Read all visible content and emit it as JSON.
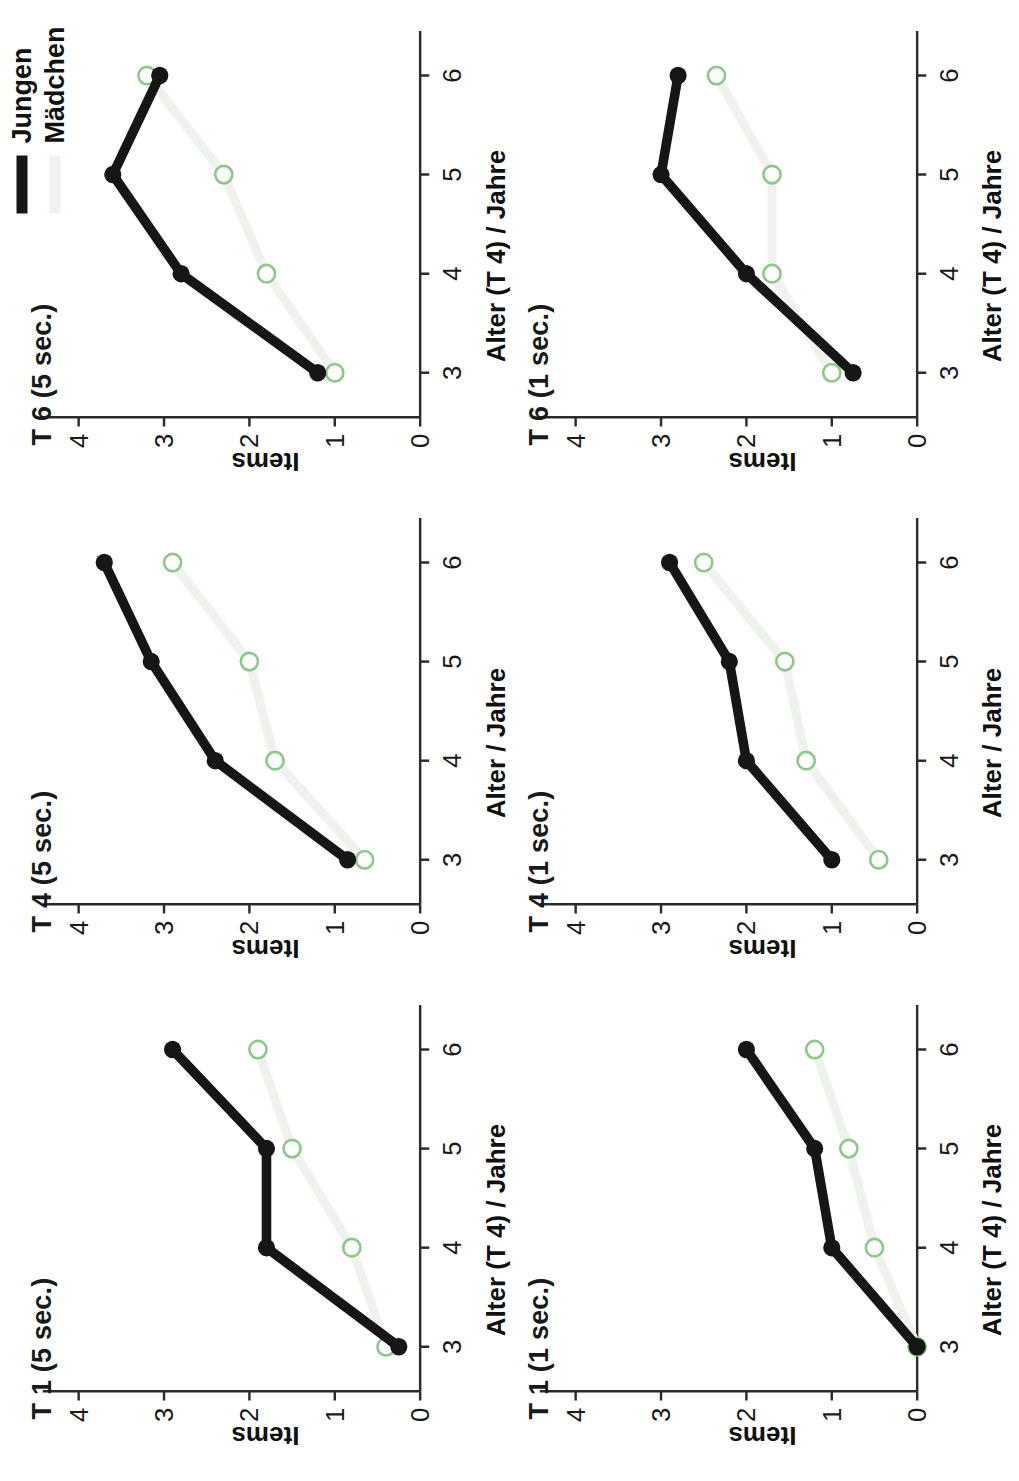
{
  "figure": {
    "title": "",
    "legend": {
      "position": "top-right",
      "entries": [
        {
          "label": "Jungen",
          "color": "#161616",
          "style": "solid-thick-filled-circles"
        },
        {
          "label": "Mädchen",
          "color": "#eef3ee",
          "marker_stroke": "#8fc78f",
          "style": "solid-thick-open-circles"
        }
      ]
    },
    "axis": {
      "x_ticks": [
        "3",
        "4",
        "5",
        "6"
      ],
      "y_ticks": [
        "0",
        "1",
        "2",
        "3",
        "4"
      ],
      "y_label": "Items"
    }
  },
  "chart_data": [
    {
      "type": "line",
      "title": "T 1 (5 sec.)",
      "xlabel": "Alter (T 4) / Jahre",
      "ylabel": "Items",
      "x": [
        3,
        4,
        5,
        6
      ],
      "xlim": [
        2.55,
        6.45
      ],
      "ylim": [
        0,
        4.35
      ],
      "grid": false,
      "series": [
        {
          "name": "Jungen",
          "values": [
            0.25,
            1.8,
            1.8,
            2.9
          ]
        },
        {
          "name": "Mädchen",
          "values": [
            0.4,
            0.8,
            1.5,
            1.9
          ]
        }
      ]
    },
    {
      "type": "line",
      "title": "T 4 (5 sec.)",
      "xlabel": "Alter / Jahre",
      "ylabel": "Items",
      "x": [
        3,
        4,
        5,
        6
      ],
      "xlim": [
        2.55,
        6.45
      ],
      "ylim": [
        0,
        4.35
      ],
      "grid": false,
      "series": [
        {
          "name": "Jungen",
          "values": [
            0.85,
            2.4,
            3.15,
            3.7
          ]
        },
        {
          "name": "Mädchen",
          "values": [
            0.65,
            1.7,
            2.0,
            2.9
          ]
        }
      ]
    },
    {
      "type": "line",
      "title": "T 6 (5 sec.)",
      "xlabel": "Alter (T 4) / Jahre",
      "ylabel": "Items",
      "x": [
        3,
        4,
        5,
        6
      ],
      "xlim": [
        2.55,
        6.45
      ],
      "ylim": [
        0,
        4.35
      ],
      "grid": false,
      "series": [
        {
          "name": "Jungen",
          "values": [
            1.2,
            2.8,
            3.6,
            3.05
          ]
        },
        {
          "name": "Mädchen",
          "values": [
            1.0,
            1.8,
            2.3,
            3.2
          ]
        }
      ]
    },
    {
      "type": "line",
      "title": "T 1 (1 sec.)",
      "xlabel": "Alter (T 4) / Jahre",
      "ylabel": "Items",
      "x": [
        3,
        4,
        5,
        6
      ],
      "xlim": [
        2.55,
        6.45
      ],
      "ylim": [
        0,
        4.35
      ],
      "grid": false,
      "series": [
        {
          "name": "Jungen",
          "values": [
            0.0,
            1.0,
            1.2,
            2.0
          ]
        },
        {
          "name": "Mädchen",
          "values": [
            0.0,
            0.5,
            0.8,
            1.2
          ]
        }
      ]
    },
    {
      "type": "line",
      "title": "T 4 (1 sec.)",
      "xlabel": "Alter / Jahre",
      "ylabel": "Items",
      "x": [
        3,
        4,
        5,
        6
      ],
      "xlim": [
        2.55,
        6.45
      ],
      "ylim": [
        0,
        4.35
      ],
      "grid": false,
      "series": [
        {
          "name": "Jungen",
          "values": [
            1.0,
            2.0,
            2.2,
            2.9
          ]
        },
        {
          "name": "Mädchen",
          "values": [
            0.45,
            1.3,
            1.55,
            2.5
          ]
        }
      ]
    },
    {
      "type": "line",
      "title": "T 6 (1 sec.)",
      "xlabel": "Alter (T 4) / Jahre",
      "ylabel": "Items",
      "x": [
        3,
        4,
        5,
        6
      ],
      "xlim": [
        2.55,
        6.45
      ],
      "ylim": [
        0,
        4.35
      ],
      "grid": false,
      "series": [
        {
          "name": "Jungen",
          "values": [
            0.75,
            2.0,
            3.0,
            2.8
          ]
        },
        {
          "name": "Mädchen",
          "values": [
            1.0,
            1.7,
            1.7,
            2.35
          ]
        }
      ]
    }
  ],
  "colors": {
    "jungen": "#161616",
    "maedchen_line": "#eef3ee",
    "maedchen_marker": "#8fc78f",
    "axis": "#2b2b2b",
    "background": "#ffffff"
  }
}
